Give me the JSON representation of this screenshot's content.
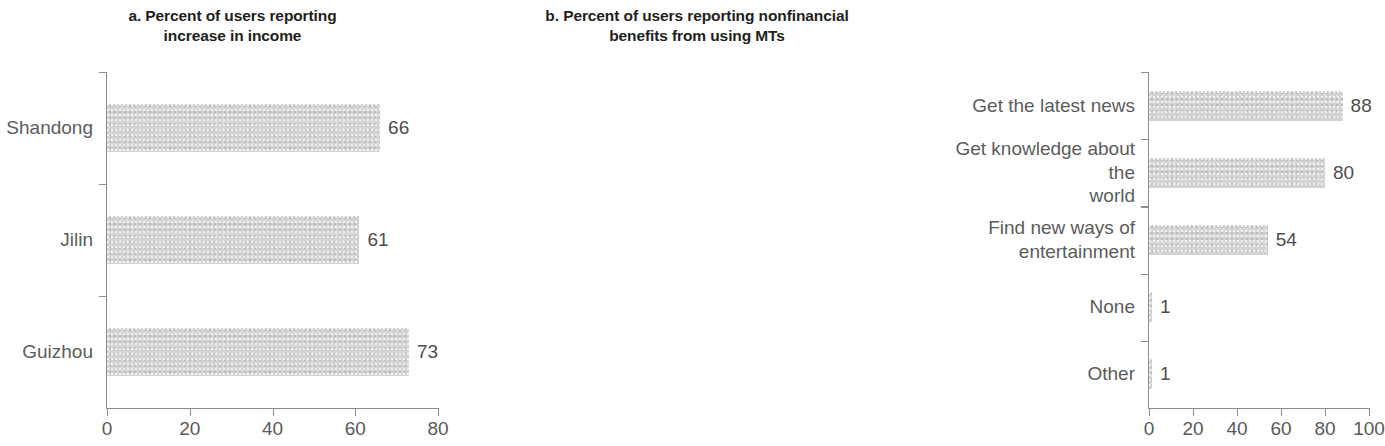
{
  "figure": {
    "background": "#ffffff",
    "bar_color": "#d2d2d2",
    "axis_color": "#8d8d8d",
    "text_color": "#5c5c5c",
    "title_color": "#231f20"
  },
  "chart_data": [
    {
      "type": "bar",
      "orientation": "horizontal",
      "panel": "a",
      "title": "a. Percent of users reporting increase in income",
      "title_line1": "a. Percent of users reporting",
      "title_line2": "increase in income",
      "categories": [
        "Shandong",
        "Jilin",
        "Guizhou"
      ],
      "values": [
        66,
        61,
        73
      ],
      "value_labels": [
        "66",
        "61",
        "73"
      ],
      "xlabel": "",
      "ylabel": "",
      "xlim": [
        0,
        80
      ],
      "xticks": [
        0,
        20,
        40,
        60,
        80
      ],
      "xtick_labels": [
        "0",
        "20",
        "40",
        "60",
        "80"
      ],
      "grid": false,
      "legend": false
    },
    {
      "type": "bar",
      "orientation": "horizontal",
      "panel": "b",
      "title": "b. Percent of users reporting nonfinancial benefits from using MTs",
      "title_line1": "b. Percent of users reporting nonfinancial",
      "title_line2": "benefits from using MTs",
      "categories": [
        "Get the latest news",
        "Get knowledge about the\nworld",
        "Find new ways of\nentertainment",
        "None",
        "Other"
      ],
      "values": [
        88,
        80,
        54,
        1,
        1
      ],
      "value_labels": [
        "88",
        "80",
        "54",
        "1",
        "1"
      ],
      "xlabel": "",
      "ylabel": "",
      "xlim": [
        0,
        100
      ],
      "xticks": [
        0,
        20,
        40,
        60,
        80,
        100
      ],
      "xtick_labels": [
        "0",
        "20",
        "40",
        "60",
        "80",
        "100"
      ],
      "grid": false,
      "legend": false
    }
  ]
}
